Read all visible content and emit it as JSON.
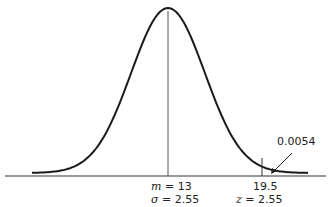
{
  "chart_data": {
    "type": "line",
    "title": "",
    "distribution": {
      "mean": 13,
      "sd": 2.55
    },
    "xlabel": "",
    "ylabel": "",
    "grid": false,
    "markers": [
      {
        "x": 13,
        "label_lines": [
          "m = 13",
          "σ = 2.55"
        ]
      },
      {
        "x": 19.5,
        "label_lines": [
          "19.5",
          "z = 2.55"
        ]
      }
    ],
    "annotations": [
      {
        "text": "0.0054",
        "points_to": "right tail area beyond x = 19.5"
      }
    ]
  },
  "labels": {
    "mean_m": "m",
    "mean_val": "= 13",
    "sigma_sym": "σ",
    "sigma_val": "= 2.55",
    "x_val": "19.5",
    "z_sym": "z",
    "z_val": "= 2.55",
    "tail_area": "0.0054"
  },
  "colors": {
    "ink": "#222222",
    "mean_line": "#555555",
    "background": "#ffffff"
  }
}
